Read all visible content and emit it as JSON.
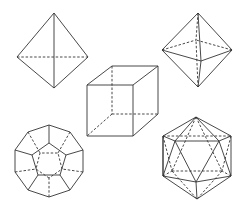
{
  "figure": {
    "background": "#ffffff",
    "line_color": "#333333",
    "solids": [
      {
        "name": "tetrahedron",
        "position": "top-left"
      },
      {
        "name": "octahedron",
        "position": "top-right"
      },
      {
        "name": "cube",
        "position": "center"
      },
      {
        "name": "dodecahedron",
        "position": "bottom-left"
      },
      {
        "name": "icosahedron",
        "position": "bottom-right"
      }
    ],
    "line_styles": {
      "visible_edges": "solid",
      "hidden_edges": "dashed"
    }
  }
}
